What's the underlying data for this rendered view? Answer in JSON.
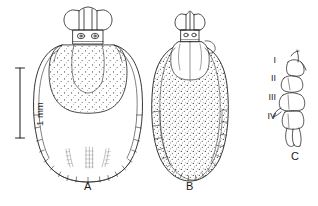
{
  "figure": {
    "type": "scientific-line-drawing",
    "background_color": "#ffffff",
    "ink_color": "#2b2b2b",
    "width": 318,
    "height": 206
  },
  "scale_bar": {
    "label": "1 mm",
    "orientation": "vertical",
    "length_px": 70,
    "x": 20,
    "y_top": 68,
    "y_bottom": 138
  },
  "panels": [
    {
      "id": "A",
      "label": "A",
      "label_x": 88,
      "label_y": 186,
      "description": "male dorsal view, stippled scutum",
      "center_x": 88,
      "center_y": 95
    },
    {
      "id": "B",
      "label": "B",
      "label_x": 190,
      "label_y": 186,
      "description": "female dorsal view, fully stippled idiosoma",
      "center_x": 190,
      "center_y": 98
    },
    {
      "id": "C",
      "label": "C",
      "label_x": 295,
      "label_y": 158,
      "description": "coxae I-IV lateral view",
      "center_x": 292,
      "center_y": 100
    }
  ],
  "coxa_labels": [
    {
      "numeral": "I",
      "x": 268,
      "y": 61
    },
    {
      "numeral": "II",
      "x": 268,
      "y": 79
    },
    {
      "numeral": "III",
      "x": 268,
      "y": 98
    },
    {
      "numeral": "IV",
      "x": 268,
      "y": 117
    }
  ]
}
